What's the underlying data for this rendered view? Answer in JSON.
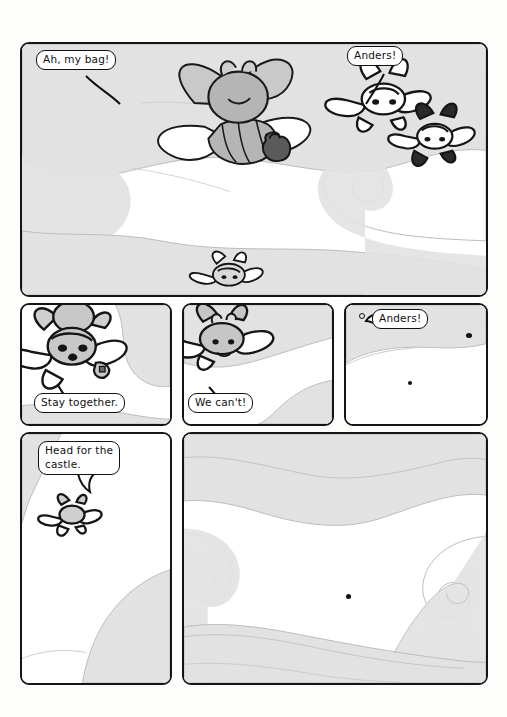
{
  "page": {
    "type": "comic-page",
    "width": 507,
    "height": 717,
    "background_color": "#fdfdfc",
    "ink_color": "#151515",
    "cloud_color": "#e2e2e2",
    "cloud_outline_color": "#b9b9b9",
    "character_fill": "#bdbdbd",
    "character_dark": "#4a4a4a"
  },
  "panels": [
    {
      "id": "panel-1",
      "position": "row-1-full-width",
      "x": 20,
      "y": 42,
      "width": 468,
      "height": 255,
      "scene": "Two winged characters flying above clouds; a bag falls away from the larger one, a smaller flyer below, and a pair of characters at right.",
      "balloons": [
        {
          "id": "balloon-ah-my-bag",
          "text": "Ah, my bag!",
          "x": 14,
          "y": 6,
          "tail": "down-right"
        },
        {
          "id": "balloon-anders-1",
          "text": "Anders!",
          "x": 325,
          "y": 2,
          "tail": "down-left"
        }
      ]
    },
    {
      "id": "panel-2",
      "position": "row-2-col-1",
      "x": 20,
      "y": 303,
      "width": 152,
      "height": 123,
      "scene": "Close view of the winged bee character hovering against a cloud.",
      "balloons": [
        {
          "id": "balloon-stay-together",
          "text": "Stay together.",
          "x": 12,
          "y": 88,
          "tail": "up-left"
        }
      ]
    },
    {
      "id": "panel-3",
      "position": "row-2-col-2",
      "x": 182,
      "y": 303,
      "width": 152,
      "height": 123,
      "scene": "A winged character flying left to right over a cloud bank.",
      "balloons": [
        {
          "id": "balloon-we-cant",
          "text": "We can't!",
          "x": 4,
          "y": 88,
          "tail": "up-left"
        }
      ]
    },
    {
      "id": "panel-4",
      "position": "row-2-col-3",
      "x": 344,
      "y": 303,
      "width": 144,
      "height": 123,
      "scene": "Wide empty sky; the characters are now tiny specks in the distance.",
      "balloons": [
        {
          "id": "balloon-anders-2",
          "text": "Anders!",
          "x": 24,
          "y": 4,
          "tail": "left"
        }
      ],
      "distant_dots": [
        {
          "x": 13,
          "y": 8,
          "size": 3,
          "style": "hollow"
        },
        {
          "x": 120,
          "y": 28,
          "size": 5,
          "style": "solid"
        },
        {
          "x": 62,
          "y": 76,
          "size": 3,
          "style": "solid"
        }
      ]
    },
    {
      "id": "panel-5",
      "position": "row-3-col-1",
      "x": 20,
      "y": 432,
      "width": 152,
      "height": 253,
      "scene": "The lone flyer, small against a tall sky with cloud banks.",
      "balloons": [
        {
          "id": "balloon-head-for-the-castle",
          "text": "Head for the\ncastle.",
          "x": 16,
          "y": 7,
          "tail": "down"
        }
      ]
    },
    {
      "id": "panel-6",
      "position": "row-3-col-2",
      "x": 182,
      "y": 432,
      "width": 306,
      "height": 253,
      "scene": "Wide view of swirling cloud banks with a single distant speck in the middle of the sky.",
      "balloons": [],
      "distant_dots": [
        {
          "x": 162,
          "y": 160,
          "size": 4,
          "style": "solid"
        }
      ]
    }
  ],
  "dialogue_order": [
    "Ah, my bag!",
    "Anders!",
    "Stay together.",
    "We can't!",
    "Anders!",
    "Head for the castle."
  ]
}
